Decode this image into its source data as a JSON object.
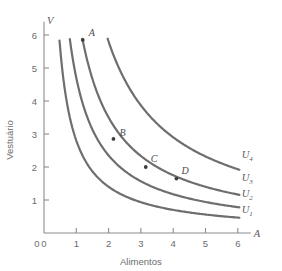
{
  "chart_data": {
    "type": "line",
    "title": "",
    "xlabel": "Alimentos",
    "ylabel": "Vestuário",
    "x_axis_symbol": "A",
    "y_axis_symbol": "V",
    "xlim": [
      0,
      6.4
    ],
    "ylim": [
      0,
      6.4
    ],
    "xticks": [
      0,
      1,
      2,
      3,
      4,
      5,
      6
    ],
    "xticklabels": [
      "0",
      "1",
      "2",
      "3",
      "4",
      "5",
      "6"
    ],
    "yticks": [
      0,
      1,
      2,
      3,
      4,
      5,
      6
    ],
    "yticklabels": [
      "0",
      "1",
      "2",
      "3",
      "4",
      "5",
      "6"
    ],
    "grid": false,
    "legend": "inline-right",
    "curve_color": "#6e6e70",
    "axis_color": "#8c8c8e",
    "point_color": "#3d3d3f",
    "series": [
      {
        "name": "U1",
        "label": "U",
        "subscript": "1",
        "k": 2.8,
        "x_start": 0.48,
        "x_end": 6.05,
        "label_x": 6.12,
        "label_y": 0.62
      },
      {
        "name": "U2",
        "label": "U",
        "subscript": "2",
        "k": 4.7,
        "x_start": 0.8,
        "x_end": 6.05,
        "label_x": 6.12,
        "label_y": 1.1
      },
      {
        "name": "U3",
        "label": "U",
        "subscript": "3",
        "k": 7.0,
        "x_start": 1.19,
        "x_end": 6.05,
        "label_x": 6.12,
        "label_y": 1.58
      },
      {
        "name": "U4",
        "label": "U",
        "subscript": "4",
        "k": 11.6,
        "x_start": 1.97,
        "x_end": 6.05,
        "label_x": 6.12,
        "label_y": 2.28
      }
    ],
    "points": [
      {
        "label": "A",
        "x": 1.2,
        "y": 5.85,
        "curve": "U3",
        "label_dx": 6,
        "label_dy": -4
      },
      {
        "label": "B",
        "x": 2.15,
        "y": 2.85,
        "curve": "U3",
        "label_dx": 6,
        "label_dy": -3
      },
      {
        "label": "C",
        "x": 3.15,
        "y": 2.0,
        "curve": "U3",
        "label_dx": 5,
        "label_dy": -5
      },
      {
        "label": "D",
        "x": 4.1,
        "y": 1.65,
        "curve": "U3",
        "label_dx": 5,
        "label_dy": -5
      }
    ],
    "annotations": []
  }
}
